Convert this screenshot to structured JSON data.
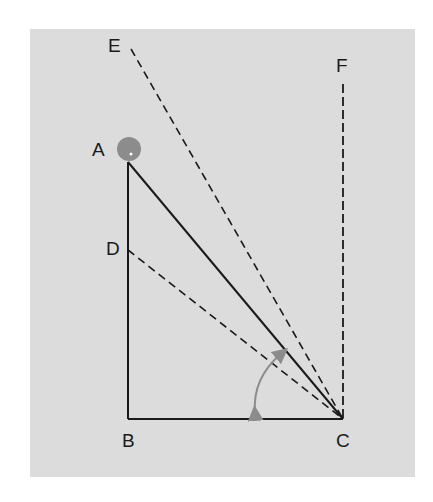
{
  "figure": {
    "background_color": "#dcdcdc",
    "line_color": "#1a1a1a",
    "ball_color": "#8c8c8c",
    "arc_color": "#8c8c8c",
    "labels": {
      "A": "A",
      "B": "B",
      "C": "C",
      "D": "D",
      "E": "E",
      "F": "F"
    },
    "points": {
      "A": [
        128,
        162
      ],
      "B": [
        128,
        419
      ],
      "C": [
        343,
        419
      ],
      "D": [
        128,
        250
      ],
      "E": [
        130,
        50
      ],
      "F": [
        343,
        88
      ]
    },
    "solid_segments": [
      "AB",
      "BC",
      "AC"
    ],
    "dashed_segments": [
      "DC",
      "EC",
      "FC"
    ],
    "ball": {
      "at": "A",
      "radius": 12
    },
    "angle_arc": {
      "center": "C",
      "description": "double-headed curved arrow between BC and DC"
    }
  }
}
